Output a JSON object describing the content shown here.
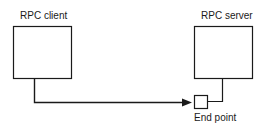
{
  "diagram": {
    "client": {
      "label": "RPC client"
    },
    "server": {
      "label": "RPC server"
    },
    "endpoint": {
      "label": "End point"
    }
  },
  "colors": {
    "stroke": "#1a1a1a",
    "background": "#ffffff"
  }
}
